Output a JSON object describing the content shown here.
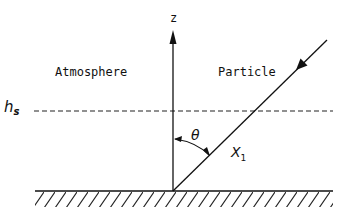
{
  "diagram": {
    "axis_label": "z",
    "region_left_label": "Atmosphere",
    "region_right_label": "Particle",
    "height_label_main": "h",
    "height_label_sub": "s",
    "angle_label": "θ",
    "path_label_main": "X",
    "path_label_sub": "1",
    "colors": {
      "ink": "#111111",
      "background": "#ffffff"
    }
  }
}
